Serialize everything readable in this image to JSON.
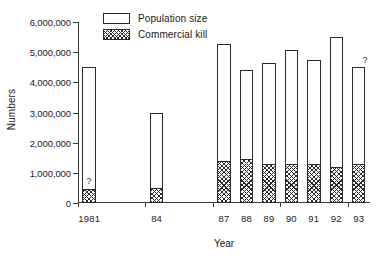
{
  "chart_data": {
    "type": "bar",
    "title": "",
    "subtitle": "",
    "xlabel": "Year",
    "ylabel": "Numbers",
    "ylim": [
      0,
      6000000
    ],
    "ytick_values": [
      0,
      1000000,
      2000000,
      3000000,
      4000000,
      5000000,
      6000000
    ],
    "ytick_labels": [
      "0",
      "1,000,000",
      "2,000,000",
      "3,000,000",
      "4,000,000",
      "5,000,000",
      "6,000,000"
    ],
    "grid": false,
    "legend_position": "top-center",
    "categories": [
      "1981",
      "84",
      "87",
      "88",
      "89",
      "90",
      "91",
      "92",
      "93"
    ],
    "category_slots": [
      0,
      3,
      6,
      7,
      8,
      9,
      10,
      11,
      12
    ],
    "total_slots": 13,
    "series": [
      {
        "name": "Population size",
        "style": "open",
        "values": [
          4500000,
          3000000,
          5280000,
          4400000,
          4650000,
          5080000,
          4750000,
          5500000,
          4500000
        ]
      },
      {
        "name": "Commercial kill",
        "style": "hatched",
        "values": [
          450000,
          500000,
          1400000,
          1450000,
          1300000,
          1300000,
          1300000,
          1200000,
          1300000
        ]
      }
    ],
    "annotations": [
      {
        "text": "?",
        "category": "1981",
        "placement": "inside-above-kill"
      },
      {
        "text": "?",
        "category": "93",
        "placement": "above-bar"
      }
    ]
  },
  "legend": {
    "items": [
      {
        "label": "Population size",
        "style": "open"
      },
      {
        "label": "Commercial kill",
        "style": "hatched"
      }
    ]
  },
  "colors": {
    "axis": "#3a3a3a",
    "bar_outline": "#2b2b2b",
    "bar_fill": "#ffffff",
    "background": "#ffffff"
  }
}
